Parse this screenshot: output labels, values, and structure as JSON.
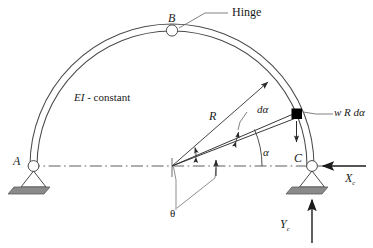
{
  "figure": {
    "type": "structural-diagram",
    "background_color": "#ffffff",
    "line_color": "#3a3a3a",
    "ground_fill": "#808080",
    "element_fill": "#000000"
  },
  "labels": {
    "hinge": "Hinge",
    "point_b": "B",
    "point_a": "A",
    "point_c": "C",
    "ei_constant": "EI - constant",
    "radius": "R",
    "d_alpha": "dα",
    "alpha": "α",
    "theta": "θ",
    "load": "w R dα",
    "reaction_x": "X",
    "reaction_x_sub": "c",
    "reaction_y": "Y",
    "reaction_y_sub": "c"
  },
  "geometry": {
    "center_x": 172,
    "center_y": 166,
    "radius_outer": 142,
    "radius_inner": 135,
    "apex_x": 172,
    "apex_y": 30,
    "support_a_x": 33,
    "support_a_y": 166,
    "support_c_x": 312,
    "support_c_y": 166,
    "alpha_degrees": 25,
    "element_angle_degrees": 28,
    "centerline_y": 166
  },
  "icons": {
    "hinge_circle": "hinge-circle",
    "pin_support": "pin-support-triangle",
    "ground_hatch": "ground-plate",
    "arrow_head": "arrow-head",
    "leader_line": "leader-line",
    "centerline": "dash-dot-centerline"
  }
}
